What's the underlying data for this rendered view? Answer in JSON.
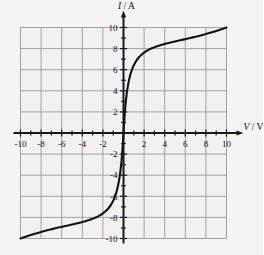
{
  "figure": {
    "background_color": "#f4f4f4",
    "plot_background_color": "#f1f1f1",
    "grid_color": "#9a9a9a",
    "axis_color": "#1a1a1a",
    "curve_color": "#141414",
    "y_axis_label": "I / A",
    "y_axis_label_symbol": "I",
    "y_axis_label_unit": "A",
    "y_axis_label_sep": " / ",
    "x_axis_label": "V / V",
    "x_axis_label_symbol": "V",
    "x_axis_label_unit": "V",
    "x_axis_label_sep": " / "
  },
  "chart_data": {
    "type": "line",
    "title": "",
    "subtitle": "",
    "xlabel": "V / V",
    "ylabel": "I / A",
    "xlim": [
      -10,
      10
    ],
    "ylim": [
      -10,
      10
    ],
    "grid": true,
    "grid_step": 2,
    "tick_step": 1,
    "legend": false,
    "legend_position": "none",
    "x_tick_labels": [
      "-10",
      "-8",
      "-6",
      "-4",
      "-2",
      "2",
      "4",
      "6",
      "8",
      "10"
    ],
    "x_tick_values": [
      -10,
      -8,
      -6,
      -4,
      -2,
      2,
      4,
      6,
      8,
      10
    ],
    "y_tick_labels": [
      "10",
      "8",
      "6",
      "4",
      "2",
      "-2",
      "-4",
      "-6",
      "-8",
      "-10"
    ],
    "y_tick_values": [
      10,
      8,
      6,
      4,
      2,
      -2,
      -4,
      -6,
      -8,
      -10
    ],
    "x_minor_ticks": [
      -9,
      -7,
      -5,
      -3,
      -1,
      1,
      3,
      5,
      7,
      9
    ],
    "y_minor_ticks": [
      -9,
      -7,
      -5,
      -3,
      -1,
      1,
      3,
      5,
      7,
      9
    ],
    "series": [
      {
        "name": "I-V characteristic",
        "color": "#141414",
        "x": [
          -10.0,
          -9.5,
          -9.0,
          -8.5,
          -8.0,
          -7.5,
          -7.0,
          -6.5,
          -6.0,
          -5.5,
          -5.0,
          -4.5,
          -4.0,
          -3.5,
          -3.0,
          -2.75,
          -2.5,
          -2.25,
          -2.0,
          -1.75,
          -1.5,
          -1.25,
          -1.0,
          -0.9,
          -0.8,
          -0.7,
          -0.6,
          -0.5,
          -0.4,
          -0.3,
          -0.2,
          -0.1,
          0.0,
          0.1,
          0.2,
          0.3,
          0.4,
          0.5,
          0.6,
          0.7,
          0.8,
          0.9,
          1.0,
          1.25,
          1.5,
          1.75,
          2.0,
          2.25,
          2.5,
          2.75,
          3.0,
          3.5,
          4.0,
          4.5,
          5.0,
          5.5,
          6.0,
          6.5,
          7.0,
          7.5,
          8.0,
          8.5,
          9.0,
          9.5,
          10.0
        ],
        "y": [
          -10.0,
          -9.83,
          -9.67,
          -9.52,
          -9.38,
          -9.25,
          -9.13,
          -9.01,
          -8.9,
          -8.79,
          -8.68,
          -8.56,
          -8.44,
          -8.3,
          -8.13,
          -8.03,
          -7.92,
          -7.78,
          -7.62,
          -7.42,
          -7.18,
          -6.86,
          -6.42,
          -6.2,
          -5.94,
          -5.64,
          -5.28,
          -4.84,
          -4.3,
          -3.62,
          -2.74,
          -1.55,
          0.0,
          1.55,
          2.74,
          3.62,
          4.3,
          4.84,
          5.28,
          5.64,
          5.94,
          6.2,
          6.42,
          6.86,
          7.18,
          7.42,
          7.62,
          7.78,
          7.92,
          8.03,
          8.13,
          8.3,
          8.44,
          8.56,
          8.68,
          8.79,
          8.9,
          9.01,
          9.13,
          9.25,
          9.38,
          9.52,
          9.67,
          9.83,
          10.0
        ]
      }
    ],
    "annotations": []
  }
}
